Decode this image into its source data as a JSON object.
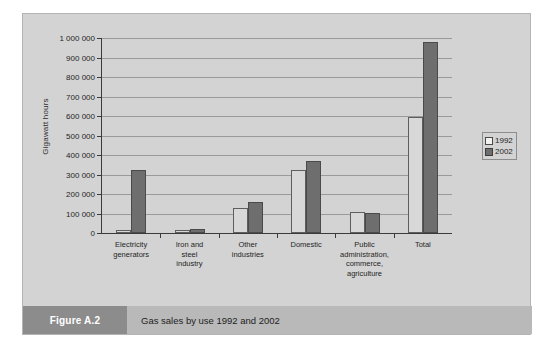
{
  "figure": {
    "tag": "Figure A.2",
    "caption": "Gas sales by use 1992 and 2002"
  },
  "colors": {
    "panel_background": "#d3d3d3",
    "series_1992": "#d8d8d8",
    "series_2002": "#6e6e6e",
    "caption_tag_background": "#8c8c8c",
    "caption_bar_background": "#b9b9b9",
    "axis": "#3b3b3b",
    "gridline": "#9a9a9a"
  },
  "chart_data": {
    "type": "bar",
    "title": "Gas sales by use 1992 and 2002",
    "xlabel": "",
    "ylabel": "Gigawatt hours",
    "ylim": [
      0,
      1000000
    ],
    "ytick_step": 100000,
    "ytick_labels": [
      "0",
      "100 000",
      "200 000",
      "300 000",
      "400 000",
      "500 000",
      "600 000",
      "700 000",
      "800 000",
      "900 000",
      "1 000 000"
    ],
    "grid": true,
    "legend_position": "right",
    "categories": [
      "Electricity generators",
      "Iron and steel industry",
      "Other industries",
      "Domestic",
      "Public administration, commerce, agriculture",
      "Total"
    ],
    "category_label_lines": [
      [
        "Electricity",
        "generators"
      ],
      [
        "Iron and",
        "steel",
        "industry"
      ],
      [
        "Other",
        "industries"
      ],
      [
        "Domestic"
      ],
      [
        "Public",
        "administration,",
        "commerce,",
        "agriculture"
      ],
      [
        "Total"
      ]
    ],
    "series": [
      {
        "name": "1992",
        "values": [
          18000,
          13000,
          130000,
          325000,
          108000,
          595000
        ]
      },
      {
        "name": "2002",
        "values": [
          325000,
          20000,
          160000,
          370000,
          103000,
          980000
        ]
      }
    ]
  }
}
